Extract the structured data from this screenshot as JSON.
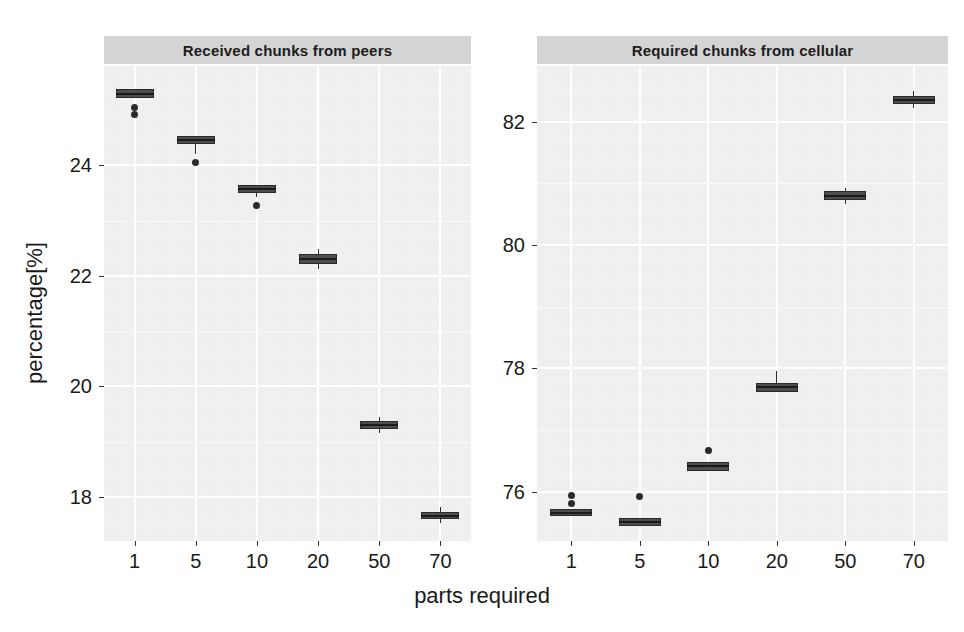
{
  "figure": {
    "xlabel": "parts required",
    "ylabel": "percentage[%]"
  },
  "panels": [
    {
      "title": "Received chunks from peers"
    },
    {
      "title": "Required chunks from cellular"
    }
  ],
  "axes": {
    "left_y_ticks": [
      "24",
      "22",
      "20",
      "18"
    ],
    "right_y_ticks": [
      "82",
      "80",
      "78",
      "76"
    ],
    "x_ticks": [
      "1",
      "5",
      "10",
      "20",
      "50",
      "70"
    ]
  },
  "chart_data": {
    "type": "box",
    "title": "",
    "xlabel": "parts required",
    "ylabel": "percentage[%]",
    "grid": true,
    "legend": "none",
    "categories": [
      "1",
      "5",
      "10",
      "20",
      "50",
      "70"
    ],
    "panels": [
      {
        "title": "Received chunks from peers",
        "ylim": [
          17.2,
          25.8
        ],
        "yticks": [
          18,
          20,
          22,
          24
        ],
        "boxes": [
          {
            "category": "1",
            "q1": 25.22,
            "median": 25.3,
            "q3": 25.38,
            "whisker_low": 25.22,
            "whisker_high": 25.38,
            "outliers": [
              25.05,
              24.93
            ]
          },
          {
            "category": "5",
            "q1": 24.38,
            "median": 24.46,
            "q3": 24.54,
            "whisker_low": 24.2,
            "whisker_high": 24.54,
            "outliers": [
              24.06
            ]
          },
          {
            "category": "10",
            "q1": 23.5,
            "median": 23.57,
            "q3": 23.64,
            "whisker_low": 23.42,
            "whisker_high": 23.64,
            "outliers": [
              23.28
            ]
          },
          {
            "category": "20",
            "q1": 22.22,
            "median": 22.3,
            "q3": 22.4,
            "whisker_low": 22.12,
            "whisker_high": 22.48,
            "outliers": []
          },
          {
            "category": "50",
            "q1": 19.23,
            "median": 19.3,
            "q3": 19.38,
            "whisker_low": 19.16,
            "whisker_high": 19.45,
            "outliers": []
          },
          {
            "category": "70",
            "q1": 17.6,
            "median": 17.66,
            "q3": 17.73,
            "whisker_low": 17.53,
            "whisker_high": 17.82,
            "outliers": []
          }
        ]
      },
      {
        "title": "Required chunks from cellular",
        "ylim": [
          75.2,
          82.9
        ],
        "yticks": [
          76,
          78,
          80,
          82
        ],
        "boxes": [
          {
            "category": "1",
            "q1": 75.6,
            "median": 75.66,
            "q3": 75.72,
            "whisker_low": 75.6,
            "whisker_high": 75.72,
            "outliers": [
              75.93,
              75.8
            ]
          },
          {
            "category": "5",
            "q1": 75.44,
            "median": 75.5,
            "q3": 75.58,
            "whisker_low": 75.44,
            "whisker_high": 75.58,
            "outliers": [
              75.92
            ]
          },
          {
            "category": "10",
            "q1": 76.34,
            "median": 76.41,
            "q3": 76.48,
            "whisker_low": 76.34,
            "whisker_high": 76.48,
            "outliers": [
              76.66
            ]
          },
          {
            "category": "20",
            "q1": 77.62,
            "median": 77.69,
            "q3": 77.76,
            "whisker_low": 77.62,
            "whisker_high": 77.95,
            "outliers": []
          },
          {
            "category": "50",
            "q1": 80.72,
            "median": 80.79,
            "q3": 80.87,
            "whisker_low": 80.66,
            "whisker_high": 80.93,
            "outliers": []
          },
          {
            "category": "70",
            "q1": 82.28,
            "median": 82.35,
            "q3": 82.42,
            "whisker_low": 82.22,
            "whisker_high": 82.5,
            "outliers": []
          }
        ]
      }
    ]
  },
  "style": {
    "panel_background": "#f2f2f2",
    "strip_background": "#d4d4d4",
    "grid_color": "#ffffff",
    "box_fill": "#4d4d4d",
    "box_stroke": "#2b2b2b",
    "text_color": "#1a1a1a"
  }
}
